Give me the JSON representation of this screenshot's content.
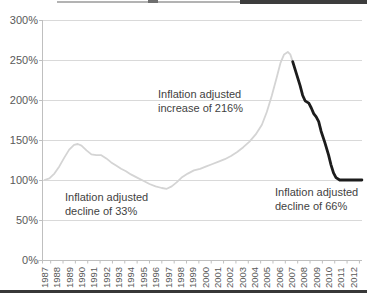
{
  "page": {
    "background": "#ffffff"
  },
  "chart_data": {
    "type": "line",
    "title": "",
    "xlabel": "",
    "ylabel": "",
    "grid": true,
    "legend": "none",
    "ylim": [
      0,
      300
    ],
    "y_ticks": [
      {
        "value": 300,
        "label": "300%"
      },
      {
        "value": 250,
        "label": "250%"
      },
      {
        "value": 200,
        "label": "200%"
      },
      {
        "value": 150,
        "label": "150%"
      },
      {
        "value": 100,
        "label": "100%"
      },
      {
        "value": 50,
        "label": "50%"
      },
      {
        "value": 0,
        "label": "0%"
      }
    ],
    "x_start_year": 1987,
    "x_labels": [
      "1987",
      "1988",
      "1989",
      "1990",
      "1991",
      "1992",
      "1993",
      "1994",
      "1995",
      "1996",
      "1997",
      "1998",
      "1999",
      "2000",
      "2001",
      "2002",
      "2003",
      "2004",
      "2005",
      "2006",
      "2007",
      "2008",
      "2009",
      "2010",
      "2011",
      "2012"
    ],
    "colors": {
      "gridline": "#d9d9d9",
      "axis": "#bfbfbf",
      "tick": "#bfbfbf",
      "tick_label": "#595959",
      "annotation": "#3f3f3f"
    },
    "series": [
      {
        "name": "history-line-light",
        "color": "#d4d4d4",
        "width": 1.8,
        "points": [
          [
            1987,
            100
          ],
          [
            1987.4,
            102
          ],
          [
            1987.8,
            108
          ],
          [
            1988.2,
            117
          ],
          [
            1988.6,
            128
          ],
          [
            1989,
            138
          ],
          [
            1989.4,
            144
          ],
          [
            1989.7,
            145
          ],
          [
            1990,
            143
          ],
          [
            1990.4,
            137
          ],
          [
            1990.8,
            132
          ],
          [
            1991.2,
            131
          ],
          [
            1991.6,
            131
          ],
          [
            1992,
            127
          ],
          [
            1992.4,
            122
          ],
          [
            1992.8,
            118
          ],
          [
            1993.2,
            114
          ],
          [
            1993.6,
            111
          ],
          [
            1994,
            107
          ],
          [
            1994.5,
            103
          ],
          [
            1995,
            99
          ],
          [
            1995.5,
            95
          ],
          [
            1996,
            92
          ],
          [
            1996.5,
            90
          ],
          [
            1996.9,
            89
          ],
          [
            1997.3,
            92
          ],
          [
            1997.7,
            97
          ],
          [
            1998.1,
            103
          ],
          [
            1998.6,
            108
          ],
          [
            1999.1,
            112
          ],
          [
            1999.6,
            114
          ],
          [
            2000.1,
            117
          ],
          [
            2000.6,
            120
          ],
          [
            2001.1,
            123
          ],
          [
            2001.6,
            126
          ],
          [
            2002.1,
            130
          ],
          [
            2002.6,
            135
          ],
          [
            2003.1,
            141
          ],
          [
            2003.6,
            148
          ],
          [
            2004.1,
            157
          ],
          [
            2004.6,
            169
          ],
          [
            2005,
            185
          ],
          [
            2005.4,
            205
          ],
          [
            2005.8,
            228
          ],
          [
            2006.1,
            246
          ],
          [
            2006.4,
            257
          ],
          [
            2006.7,
            260
          ],
          [
            2006.9,
            257
          ],
          [
            2007.1,
            248
          ]
        ]
      },
      {
        "name": "decline-line-dark",
        "color": "#1c1c1c",
        "width": 2.8,
        "points": [
          [
            2007.1,
            248
          ],
          [
            2007.4,
            233
          ],
          [
            2007.7,
            218
          ],
          [
            2007.9,
            206
          ],
          [
            2008.1,
            199
          ],
          [
            2008.4,
            196
          ],
          [
            2008.6,
            190
          ],
          [
            2008.8,
            183
          ],
          [
            2009,
            179
          ],
          [
            2009.2,
            173
          ],
          [
            2009.4,
            161
          ],
          [
            2009.7,
            147
          ],
          [
            2010,
            131
          ],
          [
            2010.2,
            119
          ],
          [
            2010.4,
            109
          ],
          [
            2010.6,
            103
          ],
          [
            2010.9,
            100
          ],
          [
            2012.7,
            100
          ]
        ]
      }
    ],
    "annotations": [
      {
        "lines": [
          "Inflation adjusted",
          "increase of 216%"
        ],
        "x": 158,
        "y": 98
      },
      {
        "lines": [
          "Inflation adjusted",
          "decline of 33%"
        ],
        "x": 65,
        "y": 201
      },
      {
        "lines": [
          "Inflation adjusted",
          "decline of 66%"
        ],
        "x": 275,
        "y": 196
      }
    ]
  }
}
